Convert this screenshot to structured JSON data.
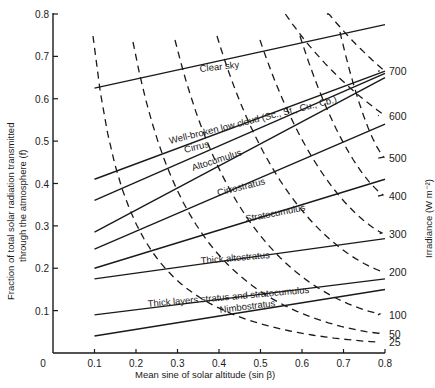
{
  "chart_data": {
    "type": "line",
    "title": "",
    "xlabel": "Mean sine of solar altitude (sin β)",
    "ylabel_line1": "Fraction of total solar radiation transmitted",
    "ylabel_line2": "through the atmosphere (f)",
    "right_label": "Irradiance (W m⁻²)",
    "xlim": [
      0,
      0.8
    ],
    "ylim": [
      0,
      0.8
    ],
    "grid": false,
    "x_ticks": [
      "0",
      "0.1",
      "0.2",
      "0.3",
      "0.4",
      "0.5",
      "0.6",
      "0.7",
      "0.8"
    ],
    "y_ticks": [
      "0.1",
      "0.2",
      "0.3",
      "0.4",
      "0.5",
      "0.6",
      "0.7",
      "0.8"
    ],
    "series": [
      {
        "name": "Clear sky",
        "x": [
          0.1,
          0.8
        ],
        "y": [
          0.625,
          0.775
        ]
      },
      {
        "name": "Well-broken low cloud (Sc., St., Cu., Cb.)",
        "x": [
          0.1,
          0.8
        ],
        "y": [
          0.41,
          0.665
        ]
      },
      {
        "name": "Cirrus",
        "x": [
          0.1,
          0.8
        ],
        "y": [
          0.36,
          0.66
        ]
      },
      {
        "name": "Altocumulus",
        "x": [
          0.1,
          0.8
        ],
        "y": [
          0.285,
          0.65
        ]
      },
      {
        "name": "Cirrostratus",
        "x": [
          0.1,
          0.8
        ],
        "y": [
          0.245,
          0.54
        ]
      },
      {
        "name": "Stratocumulus",
        "x": [
          0.1,
          0.8
        ],
        "y": [
          0.2,
          0.41
        ]
      },
      {
        "name": "Thick altostratus",
        "x": [
          0.1,
          0.8
        ],
        "y": [
          0.175,
          0.27
        ]
      },
      {
        "name": "Thick layers stratus and stratocumulus",
        "x": [
          0.1,
          0.8
        ],
        "y": [
          0.09,
          0.175
        ]
      },
      {
        "name": "Nimbostratus",
        "x": [
          0.1,
          0.8
        ],
        "y": [
          0.04,
          0.15
        ]
      }
    ],
    "isolines": {
      "label": "Irradiance (W m⁻²)",
      "style": "dashed",
      "values": [
        700,
        600,
        500,
        400,
        300,
        200,
        100,
        50,
        25
      ],
      "right_end_f": [
        0.665,
        0.56,
        0.46,
        0.37,
        0.28,
        0.19,
        0.09,
        0.045,
        0.025
      ]
    }
  },
  "labels": {
    "clear_sky": "Clear sky",
    "well_broken": "Well-broken low cloud (Sc., St., Cu., Cb.)",
    "cirrus": "Cirrus",
    "altocumulus": "Altocumulus",
    "cirrostratus": "Cirrostratus",
    "stratocumulus": "Stratocumulus",
    "thick_altostratus": "Thick altostratus",
    "thick_layers": "Thick layers stratus and stratocumulus",
    "nimbostratus": "Nimbostratus"
  },
  "axes": {
    "x_ticks": [
      "0",
      "0.1",
      "0.2",
      "0.3",
      "0.4",
      "0.5",
      "0.6",
      "0.7",
      "0.8"
    ],
    "y_ticks": [
      "0.1",
      "0.2",
      "0.3",
      "0.4",
      "0.5",
      "0.6",
      "0.7",
      "0.8"
    ],
    "xlabel": "Mean sine of solar altitude (sin β)",
    "ylabel_line1": "Fraction of total solar radiation transmitted",
    "ylabel_line2": "through the atmosphere (f)",
    "right_label": "Irradiance (W m⁻²)"
  },
  "isolabels": [
    "700",
    "600",
    "500",
    "400",
    "300",
    "200",
    "100",
    "50",
    "25"
  ]
}
